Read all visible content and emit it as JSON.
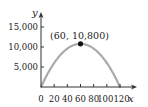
{
  "chart_data": {
    "type": "line",
    "title": "",
    "xlabel": "x",
    "ylabel": "y",
    "xlim": [
      0,
      125
    ],
    "ylim": [
      0,
      18000
    ],
    "x_ticks": [
      0,
      20,
      40,
      60,
      80,
      100,
      120
    ],
    "x_tick_labels": [
      "0",
      "20",
      "40",
      "60",
      "80",
      "100",
      "120"
    ],
    "y_ticks": [
      5000,
      10000,
      15000
    ],
    "y_tick_labels": [
      "5,000",
      "10,000",
      "15,000"
    ],
    "grid": false,
    "legend": null,
    "series": [
      {
        "name": "parabola",
        "description": "downward-opening parabola with roots at x=0 and x=120, vertex at (60, 10800)",
        "x": [
          0,
          10,
          20,
          30,
          40,
          50,
          60,
          70,
          80,
          90,
          100,
          110,
          120
        ],
        "values": [
          0,
          3300,
          6000,
          8100,
          9600,
          10500,
          10800,
          10500,
          9600,
          8100,
          6000,
          3300,
          0
        ],
        "color": "#aaaaaa"
      }
    ],
    "annotations": [
      {
        "label": "(60, 10,800)",
        "x": 60,
        "y": 10800,
        "marker": "filled-dot"
      }
    ]
  }
}
